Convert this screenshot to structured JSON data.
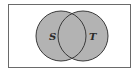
{
  "diagram": {
    "type": "venn",
    "universe": {
      "label": ""
    },
    "sets": [
      {
        "label": "S"
      },
      {
        "label": "T"
      }
    ],
    "colors": {
      "fill": "#b3b3b3",
      "stroke": "#3a3a3a",
      "border": "#6a6a6a",
      "background": "#ffffff"
    }
  }
}
